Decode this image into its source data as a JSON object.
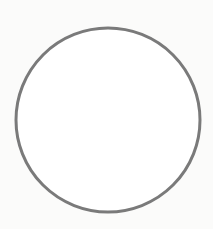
{
  "diagram": {
    "shapes": [
      {
        "type": "circle",
        "cx": 108,
        "cy": 120,
        "r": 92,
        "stroke": "#7a7a7a",
        "stroke_width": 3,
        "fill": "#ffffff"
      }
    ],
    "background": "#fbfbfa"
  }
}
